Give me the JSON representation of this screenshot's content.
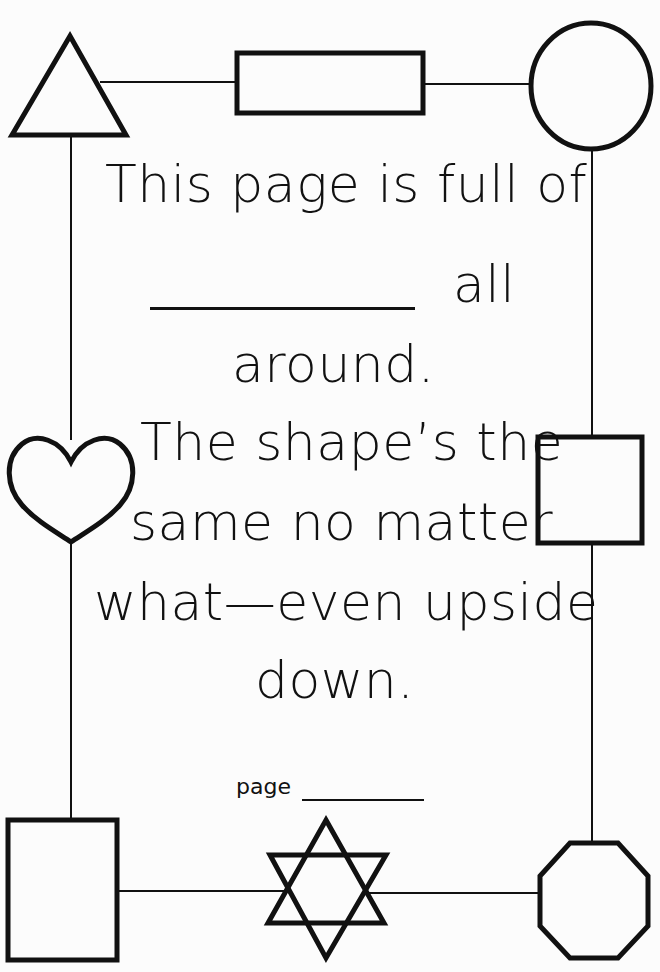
{
  "worksheet": {
    "lines": [
      "This page is full of",
      "all",
      "around.",
      "The shape’s the",
      "same no matter",
      "what—even upside",
      "down."
    ],
    "page_label": "page"
  },
  "shapes": [
    {
      "name": "triangle",
      "position": "top-left"
    },
    {
      "name": "rectangle",
      "position": "top-center"
    },
    {
      "name": "circle",
      "position": "top-right"
    },
    {
      "name": "heart",
      "position": "middle-left"
    },
    {
      "name": "square",
      "position": "middle-right"
    },
    {
      "name": "tall-rectangle",
      "position": "bottom-left"
    },
    {
      "name": "six-pointed-star",
      "position": "bottom-center"
    },
    {
      "name": "octagon",
      "position": "bottom-right"
    }
  ],
  "colors": {
    "ink": "#111111",
    "paper": "#fcfcfc"
  }
}
